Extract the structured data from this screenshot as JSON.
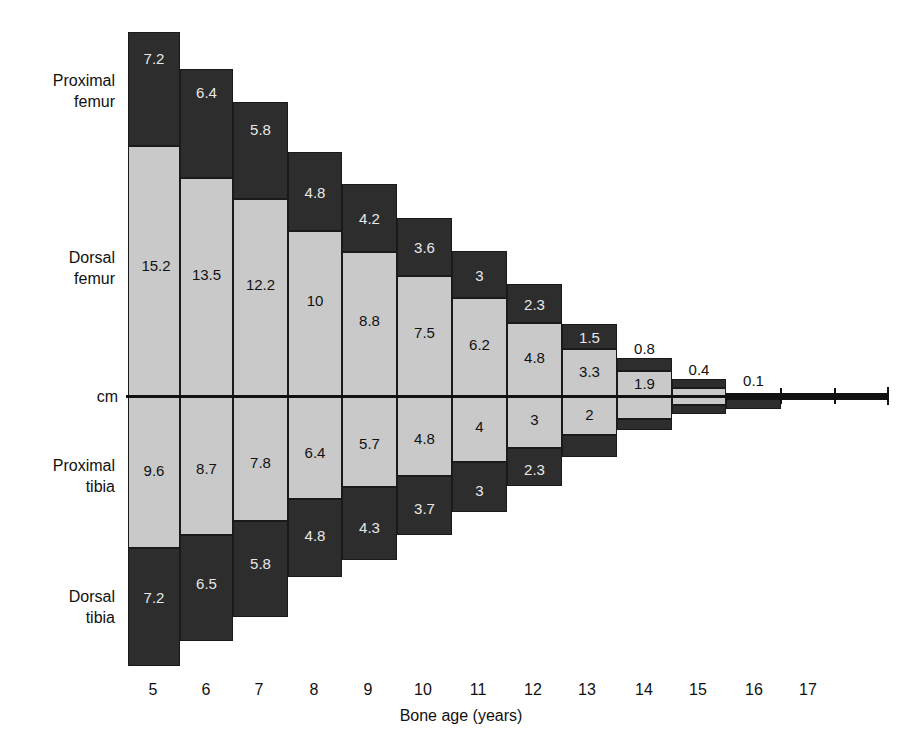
{
  "chart_data": {
    "type": "bar",
    "subtype": "diverging stacked bar (growth remaining per physis)",
    "title": "",
    "xlabel": "Bone age (years)",
    "ylabel": "cm",
    "categories": [
      "5",
      "6",
      "7",
      "8",
      "9",
      "10",
      "11",
      "12",
      "13",
      "14",
      "15",
      "16",
      "17"
    ],
    "series": [
      {
        "name": "Proximal femur",
        "position": "above axis, outer",
        "values": [
          7.2,
          6.4,
          5.8,
          4.8,
          4.2,
          3.6,
          3,
          2.3,
          1.5,
          0.8,
          0.4,
          0.1,
          null
        ]
      },
      {
        "name": "Dorsal femur",
        "position": "above axis, inner",
        "values": [
          15.2,
          13.5,
          12.2,
          10,
          8.8,
          7.5,
          6.2,
          4.8,
          3.3,
          1.9,
          null,
          null,
          null
        ]
      },
      {
        "name": "Proximal tibia",
        "position": "below axis, inner",
        "values": [
          9.6,
          8.7,
          7.8,
          6.4,
          5.7,
          4.8,
          4,
          3,
          2,
          null,
          null,
          null,
          null
        ]
      },
      {
        "name": "Dorsal tibia",
        "position": "below axis, outer",
        "values": [
          7.2,
          6.5,
          5.8,
          4.8,
          4.3,
          3.7,
          3,
          2.3,
          null,
          null,
          null,
          null,
          null
        ]
      }
    ],
    "row_labels": [
      "Proximal femur",
      "Dorsal femur",
      "cm",
      "Proximal tibia",
      "Dorsal tibia"
    ],
    "colors": {
      "dark": "#2d2d2d",
      "light": "#c9c9c9",
      "axis": "#111111"
    },
    "legend": "none (row labels at left)",
    "grid": false
  },
  "labels": {
    "proximal_femur_1": "Proximal",
    "proximal_femur_2": "femur",
    "dorsal_femur_1": "Dorsal",
    "dorsal_femur_2": "femur",
    "cm": "cm",
    "proximal_tibia_1": "Proximal",
    "proximal_tibia_2": "tibia",
    "dorsal_tibia_1": "Dorsal",
    "dorsal_tibia_2": "tibia",
    "xlabel": "Bone age (years)"
  },
  "xticks": [
    "5",
    "6",
    "7",
    "8",
    "9",
    "10",
    "11",
    "12",
    "13",
    "14",
    "15",
    "16",
    "17"
  ],
  "columns": [
    {
      "x": 128,
      "w": 52,
      "top": 32,
      "df": 146,
      "pt": 548,
      "bot": 666,
      "pf": "7.2",
      "dfv": "15.2",
      "ptv": "9.6",
      "dtv": "7.2"
    },
    {
      "x": 180,
      "w": 53,
      "top": 69,
      "df": 178,
      "pt": 535,
      "bot": 641,
      "pf": "6.4",
      "dfv": "13.5",
      "ptv": "8.7",
      "dtv": "6.5"
    },
    {
      "x": 233,
      "w": 55,
      "top": 102,
      "df": 199,
      "pt": 521,
      "bot": 617,
      "pf": "5.8",
      "dfv": "12.2",
      "ptv": "7.8",
      "dtv": "5.8"
    },
    {
      "x": 288,
      "w": 54,
      "top": 152,
      "df": 231,
      "pt": 499,
      "bot": 577,
      "pf": "4.8",
      "dfv": "10",
      "ptv": "6.4",
      "dtv": "4.8"
    },
    {
      "x": 342,
      "w": 55,
      "top": 184,
      "df": 252,
      "pt": 487,
      "bot": 560,
      "pf": "4.2",
      "dfv": "8.8",
      "ptv": "5.7",
      "dtv": "4.3"
    },
    {
      "x": 397,
      "w": 55,
      "top": 218,
      "df": 276,
      "pt": 476,
      "bot": 535,
      "pf": "3.6",
      "dfv": "7.5",
      "ptv": "4.8",
      "dtv": "3.7"
    },
    {
      "x": 452,
      "w": 55,
      "top": 251,
      "df": 298,
      "pt": 462,
      "bot": 512,
      "pf": "3",
      "dfv": "6.2",
      "ptv": "4",
      "dtv": "3"
    },
    {
      "x": 507,
      "w": 55,
      "top": 284,
      "df": 323,
      "pt": 448,
      "bot": 486,
      "pf": "2.3",
      "dfv": "4.8",
      "ptv": "3",
      "dtv": "2.3"
    },
    {
      "x": 562,
      "w": 55,
      "top": 324,
      "df": 349,
      "pt": 435,
      "bot": 457,
      "pf": "1.5",
      "dfv": "3.3",
      "ptv": "2",
      "dtv": ""
    },
    {
      "x": 617,
      "w": 55,
      "top": 358,
      "df": 371,
      "pt": 419,
      "bot": 430,
      "pf": "0.8",
      "dfv": "1.9",
      "ptv": "",
      "dtv": ""
    },
    {
      "x": 672,
      "w": 54,
      "top": 379,
      "df": 388,
      "pt": 405,
      "bot": 414,
      "pf": "0.4",
      "dfv": "",
      "ptv": "",
      "dtv": ""
    }
  ],
  "col16": {
    "x": 726,
    "w": 55,
    "top": 393,
    "bot": 409,
    "label": "0.1"
  }
}
